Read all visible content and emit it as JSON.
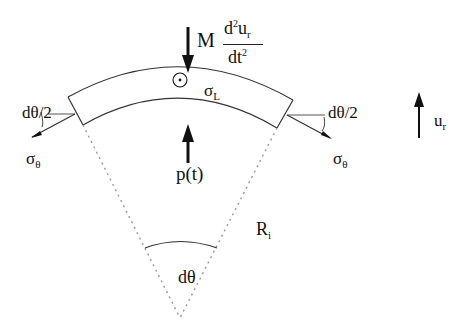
{
  "diagram": {
    "type": "free-body diagram of curved shell element",
    "labels": {
      "mass_term": {
        "prefix": "M",
        "numerator": "d",
        "num_sup": "2",
        "num_var": "u",
        "num_sub": "r",
        "denominator": "dt",
        "den_sup": "2"
      },
      "sigma_L": {
        "main": "σ",
        "sub": "L"
      },
      "pressure": "p(t)",
      "half_angle_left": "dθ/2",
      "half_angle_right": "dθ/2",
      "sigma_theta_left": {
        "main": "σ",
        "sub": "θ"
      },
      "sigma_theta_right": {
        "main": "σ",
        "sub": "θ"
      },
      "radial_disp": {
        "main": "u",
        "sub": "r"
      },
      "radius": {
        "main": "R",
        "sub": "i"
      },
      "angle": "dθ"
    },
    "colors": {
      "line": "#111111",
      "dotted": "#999999"
    }
  }
}
